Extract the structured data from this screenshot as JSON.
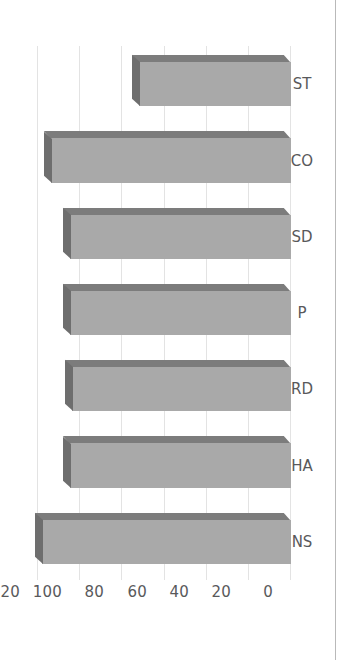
{
  "figure": {
    "orientation": "rotated-90",
    "background": "#ffffff",
    "frame_color": "#b9b9b9",
    "bar_front_color": "#a9a9a9",
    "bar_top_color": "#6e6e6e",
    "bar_side_color": "#7c7c7c",
    "gridline_color": "#e3e3e3",
    "tick_label_color": "#59595b"
  },
  "chart_data": {
    "type": "bar",
    "title": "",
    "subtitle": "",
    "xlabel": "",
    "ylabel": "",
    "orientation": "vertical-rotated",
    "categories": [
      "NS",
      "HA",
      "RD",
      "P",
      "SD",
      "CO",
      "ST"
    ],
    "values": [
      118,
      105,
      104,
      105,
      105,
      114,
      72
    ],
    "ylim": [
      0,
      120
    ],
    "yticks": [
      0,
      20,
      40,
      60,
      80,
      100,
      120
    ],
    "ytick_labels": [
      "0",
      "20",
      "40",
      "60",
      "80",
      "100",
      "120"
    ],
    "grid": true,
    "grid_axis": "y",
    "legend": false,
    "legend_entries": [],
    "annotations": [],
    "style": "3d-bar"
  }
}
